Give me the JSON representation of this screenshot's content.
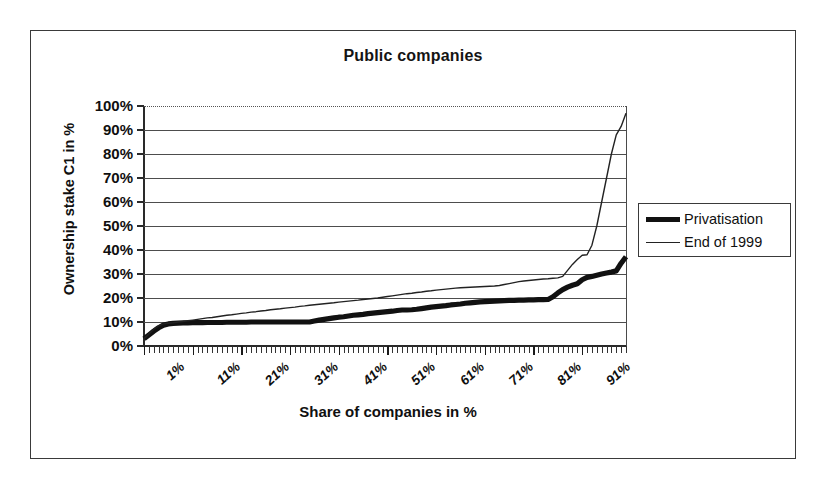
{
  "chart_data": {
    "type": "line",
    "title": "Public companies",
    "xlabel": "Share of companies in %",
    "ylabel": "Ownership stake C1 in %",
    "grid": true,
    "legend_position": "right",
    "xlim": [
      1,
      100
    ],
    "ylim": [
      0,
      100
    ],
    "ytick_labels": [
      "100%",
      "90%",
      "80%",
      "70%",
      "60%",
      "50%",
      "40%",
      "30%",
      "20%",
      "10%",
      "0%"
    ],
    "ytick_values": [
      100,
      90,
      80,
      70,
      60,
      50,
      40,
      30,
      20,
      10,
      0
    ],
    "xtick_labels": [
      "1%",
      "11%",
      "21%",
      "31%",
      "41%",
      "51%",
      "61%",
      "71%",
      "81%",
      "91%"
    ],
    "xtick_values": [
      1,
      11,
      21,
      31,
      41,
      51,
      61,
      71,
      81,
      91
    ],
    "x": [
      1,
      2,
      3,
      4,
      5,
      6,
      7,
      8,
      9,
      10,
      11,
      12,
      13,
      14,
      15,
      16,
      17,
      18,
      19,
      20,
      21,
      22,
      23,
      24,
      25,
      26,
      27,
      28,
      29,
      30,
      31,
      32,
      33,
      34,
      35,
      36,
      37,
      38,
      39,
      40,
      41,
      42,
      43,
      44,
      45,
      46,
      47,
      48,
      49,
      50,
      51,
      52,
      53,
      54,
      55,
      56,
      57,
      58,
      59,
      60,
      61,
      62,
      63,
      64,
      65,
      66,
      67,
      68,
      69,
      70,
      71,
      72,
      73,
      74,
      75,
      76,
      77,
      78,
      79,
      80,
      81,
      82,
      83,
      84,
      85,
      86,
      87,
      88,
      89,
      90,
      91,
      92,
      93,
      94,
      95,
      96,
      97,
      98,
      99,
      100
    ],
    "series": [
      {
        "name": "Privatisation",
        "style": "thick",
        "color": "#111111",
        "values": [
          3.0,
          4.6,
          6.2,
          7.6,
          8.7,
          9.2,
          9.4,
          9.5,
          9.6,
          9.6,
          9.7,
          9.7,
          9.7,
          9.8,
          9.8,
          9.8,
          9.8,
          9.9,
          9.9,
          9.9,
          9.9,
          9.9,
          10.0,
          10.0,
          10.0,
          10.0,
          10.0,
          10.0,
          10.0,
          10.0,
          10.0,
          10.0,
          10.0,
          10.0,
          10.0,
          10.4,
          10.8,
          11.1,
          11.4,
          11.7,
          12.0,
          12.2,
          12.5,
          12.8,
          13.0,
          13.2,
          13.5,
          13.7,
          13.9,
          14.1,
          14.3,
          14.5,
          14.8,
          15.0,
          15.0,
          15.1,
          15.3,
          15.6,
          15.9,
          16.2,
          16.4,
          16.6,
          16.8,
          17.1,
          17.3,
          17.5,
          17.8,
          18.0,
          18.2,
          18.4,
          18.5,
          18.6,
          18.7,
          18.8,
          18.9,
          19.0,
          19.0,
          19.1,
          19.1,
          19.2,
          19.2,
          19.3,
          19.3,
          19.4,
          20.5,
          22.1,
          23.5,
          24.5,
          25.3,
          25.9,
          27.6,
          28.6,
          29.0,
          29.5,
          30.0,
          30.4,
          30.8,
          31.3,
          34.5,
          37.2
        ]
      },
      {
        "name": "End of 1999",
        "style": "thin",
        "color": "#222222",
        "values": [
          3.0,
          5.0,
          7.0,
          8.4,
          9.2,
          9.5,
          9.7,
          10.0,
          10.2,
          10.5,
          10.8,
          11.1,
          11.4,
          11.7,
          11.9,
          12.2,
          12.5,
          12.8,
          13.0,
          13.3,
          13.6,
          13.8,
          14.1,
          14.3,
          14.6,
          14.8,
          15.1,
          15.3,
          15.5,
          15.8,
          16.0,
          16.2,
          16.5,
          16.7,
          17.0,
          17.2,
          17.4,
          17.6,
          17.8,
          18.0,
          18.3,
          18.5,
          18.7,
          18.9,
          19.1,
          19.4,
          19.6,
          19.8,
          20.0,
          20.3,
          20.6,
          20.9,
          21.2,
          21.5,
          21.8,
          22.0,
          22.3,
          22.5,
          22.8,
          23.0,
          23.3,
          23.5,
          23.7,
          23.9,
          24.1,
          24.3,
          24.4,
          24.5,
          24.6,
          24.7,
          24.8,
          24.9,
          25.0,
          25.2,
          25.6,
          26.0,
          26.4,
          26.8,
          27.1,
          27.3,
          27.5,
          27.7,
          27.9,
          28.0,
          28.2,
          28.4,
          29.0,
          31.5,
          34.0,
          36.0,
          37.8,
          38.0,
          42.0,
          50.0,
          60.0,
          70.0,
          80.0,
          88.0,
          91.5,
          97.0
        ]
      }
    ]
  },
  "legend": {
    "items": [
      {
        "label": "Privatisation",
        "swatch": "thick-line-swatch"
      },
      {
        "label": "End of 1999",
        "swatch": "thin-line-swatch"
      }
    ]
  }
}
